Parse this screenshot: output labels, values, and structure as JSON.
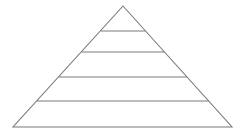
{
  "image": {
    "title": "Pyramid diagram",
    "background_color": "#ffffff",
    "width": 246,
    "height": 139
  },
  "diagram": {
    "type": "pyramid",
    "name": "five-level-pyramid",
    "line_color": "#7b7b7b",
    "fill_color": "#ffffff",
    "stroke_width": 1.1,
    "level_count": 5,
    "apex": {
      "x": 123,
      "y": 6
    },
    "base_left": {
      "x": 13,
      "y": 127
    },
    "base_right": {
      "x": 232,
      "y": 127
    },
    "outline_points": "123,6 232,127 13,127",
    "dividers": [
      {
        "name": "divider-1",
        "y": 31,
        "x1": 100.7,
        "x2": 145.3,
        "label": ""
      },
      {
        "name": "divider-2",
        "y": 52,
        "x1": 81.6,
        "x2": 164.4,
        "label": ""
      },
      {
        "name": "divider-3",
        "y": 77,
        "x1": 58.8,
        "x2": 187.2,
        "label": ""
      },
      {
        "name": "divider-4",
        "y": 101,
        "x1": 37.0,
        "x2": 209.1,
        "label": ""
      }
    ],
    "levels": [
      {
        "index": 1,
        "name": "pyramid-level-1-apex",
        "label": ""
      },
      {
        "index": 2,
        "name": "pyramid-level-2",
        "label": ""
      },
      {
        "index": 3,
        "name": "pyramid-level-3",
        "label": ""
      },
      {
        "index": 4,
        "name": "pyramid-level-4",
        "label": ""
      },
      {
        "index": 5,
        "name": "pyramid-level-5-base",
        "label": ""
      }
    ]
  }
}
